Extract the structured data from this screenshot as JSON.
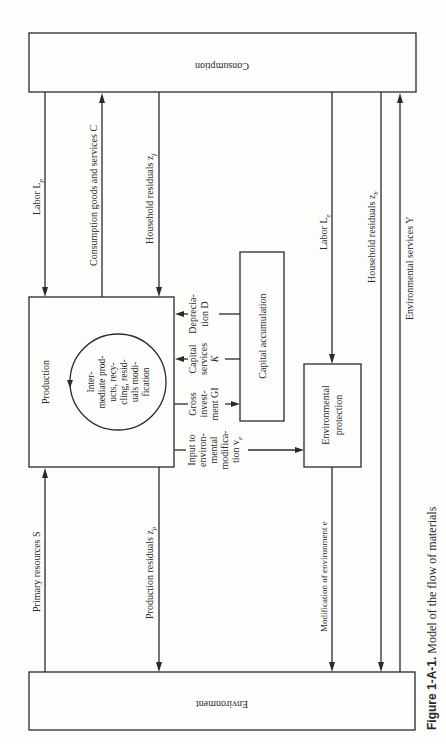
{
  "nodes": {
    "consumption": "Consumption",
    "environment": "Environment",
    "production": "Production",
    "intermediate": [
      "Inter-",
      "mediate prod-",
      "ucts, recy-",
      "cling, resid-",
      "uals modi-",
      "fication"
    ],
    "capital_accumulation": "Capital accumulation",
    "environmental_protection": [
      "Environmental",
      "protection"
    ]
  },
  "flows": {
    "labor_lp": "Labor L",
    "labor_lp_sub": "p",
    "consumption_goods": "Consumption goods  and services C",
    "household_residuals_zf": "Household residuals z",
    "household_residuals_zf_sub": "f",
    "labor_le": "Labor L",
    "labor_le_sub": "e",
    "household_residuals_zh": "Household residuals z",
    "household_residuals_zh_sub": "h",
    "environmental_services": "Environmental services Y",
    "primary_resources": "Primary resources S",
    "production_residuals": "Production residuals z",
    "production_residuals_sub": "p",
    "modification_environment": "Modification of environment e",
    "depreciation": [
      "Deprecia-",
      "tion D"
    ],
    "capital_services": [
      "Capital",
      "services",
      "K"
    ],
    "gross_investment": [
      "Gross",
      "invest-",
      "ment GI"
    ],
    "input_env_mod": [
      "Input to",
      "environ-",
      "mental",
      "modifica-",
      "tion v"
    ],
    "input_env_mod_sub": "e"
  },
  "caption": {
    "label": "Figure 1-A-1.",
    "text": " Model of the flow of materials"
  }
}
